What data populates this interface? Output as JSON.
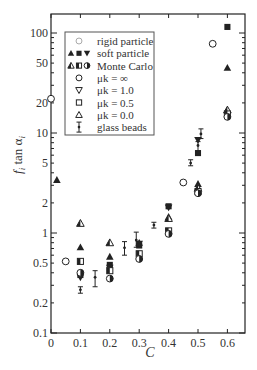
{
  "chart_data": {
    "type": "scatter",
    "title": "",
    "xlabel": "C",
    "ylabel": "f_i tan α_i",
    "xscale": "linear",
    "yscale": "log",
    "xlim": [
      0,
      0.66
    ],
    "ylim": [
      0.1,
      150
    ],
    "x_ticks": [
      0,
      0.1,
      0.2,
      0.3,
      0.4,
      0.5,
      0.6
    ],
    "x_tick_labels": [
      "0",
      "0.1",
      "0.2",
      "0.3",
      "0.4",
      "0.5",
      "0.6"
    ],
    "y_ticks": [
      0.1,
      0.2,
      0.5,
      1,
      2,
      5,
      10,
      20,
      50,
      100
    ],
    "y_tick_labels": [
      "0.1",
      "0.2",
      "0.5",
      "1",
      "2",
      "5",
      "10",
      "20",
      "50",
      "100"
    ],
    "grid": false,
    "legend_position": "upper left",
    "legend": [
      {
        "marker": "open-circle-light",
        "label": "rigid particle"
      },
      {
        "marker": "filled-triangle filled-square filled-down-triangle",
        "label": "soft particle"
      },
      {
        "marker": "half-triangle half-square half-circle",
        "label": "Monte Carlo"
      },
      {
        "marker": "open-circle",
        "label": "μk = ∞"
      },
      {
        "marker": "open-down-triangle",
        "label": "μk = 1.0"
      },
      {
        "marker": "open-square",
        "label": "μk = 0.5"
      },
      {
        "marker": "open-triangle",
        "label": "μk = 0.0"
      },
      {
        "marker": "errorbar",
        "label": "glass beads"
      }
    ],
    "series": [
      {
        "name": "rigid particle",
        "marker": "open-circle",
        "points": [
          [
            0.0,
            22
          ],
          [
            0.05,
            0.52
          ],
          [
            0.45,
            3.2
          ],
          [
            0.55,
            78
          ]
        ]
      },
      {
        "name": "soft particle μk=0.0",
        "marker": "filled-triangle",
        "points": [
          [
            0.02,
            3.4
          ],
          [
            0.1,
            0.72
          ],
          [
            0.2,
            0.58
          ],
          [
            0.3,
            0.8
          ],
          [
            0.4,
            1.45
          ],
          [
            0.5,
            3.1
          ],
          [
            0.6,
            45
          ]
        ]
      },
      {
        "name": "soft particle μk=0.5",
        "marker": "filled-square",
        "points": [
          [
            0.1,
            0.38
          ],
          [
            0.2,
            0.48
          ],
          [
            0.3,
            0.75
          ],
          [
            0.4,
            1.85
          ],
          [
            0.5,
            6.3
          ],
          [
            0.6,
            115
          ]
        ]
      },
      {
        "name": "soft particle μk=1.0",
        "marker": "filled-down-triangle",
        "points": [
          [
            0.1,
            0.36
          ],
          [
            0.2,
            0.45
          ],
          [
            0.3,
            0.78
          ],
          [
            0.4,
            1.8
          ],
          [
            0.5,
            8.5
          ]
        ]
      },
      {
        "name": "Monte Carlo μk=0.0",
        "marker": "half-triangle",
        "points": [
          [
            0.1,
            1.25
          ],
          [
            0.2,
            0.8
          ],
          [
            0.4,
            1.4
          ],
          [
            0.5,
            2.8
          ],
          [
            0.6,
            17
          ]
        ]
      },
      {
        "name": "Monte Carlo μk=0.5",
        "marker": "half-square",
        "points": [
          [
            0.1,
            0.52
          ],
          [
            0.2,
            0.42
          ],
          [
            0.3,
            0.62
          ],
          [
            0.4,
            1.05
          ],
          [
            0.5,
            2.6
          ],
          [
            0.6,
            15.5
          ]
        ]
      },
      {
        "name": "Monte Carlo μk=∞",
        "marker": "half-circle",
        "points": [
          [
            0.1,
            0.4
          ],
          [
            0.2,
            0.35
          ],
          [
            0.3,
            0.55
          ],
          [
            0.4,
            0.98
          ],
          [
            0.5,
            2.5
          ],
          [
            0.6,
            14.5
          ]
        ]
      },
      {
        "name": "glass beads",
        "marker": "errorbar",
        "points": [
          [
            0.1,
            0.27,
            0.25,
            0.29
          ],
          [
            0.15,
            0.36,
            0.29,
            0.42
          ],
          [
            0.25,
            0.71,
            0.6,
            0.82
          ],
          [
            0.29,
            0.85,
            0.72,
            1.02
          ],
          [
            0.35,
            1.2,
            1.12,
            1.28
          ],
          [
            0.475,
            5.0,
            4.7,
            5.4
          ],
          [
            0.5,
            7.5,
            6.5,
            8.2
          ],
          [
            0.51,
            9.8,
            8.8,
            11
          ]
        ]
      }
    ]
  }
}
